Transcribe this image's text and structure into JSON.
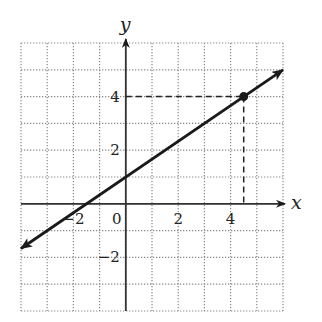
{
  "chart_data": {
    "type": "line",
    "title": "",
    "xlabel": "x",
    "ylabel": "y",
    "xlim": [
      -4,
      6
    ],
    "ylim": [
      -4,
      6
    ],
    "grid": true,
    "grid_style": "dotted",
    "x_tick_labels": [
      {
        "value": -2,
        "label": "−2"
      },
      {
        "value": 0,
        "label": "0"
      },
      {
        "value": 2,
        "label": "2"
      },
      {
        "value": 4,
        "label": "4"
      }
    ],
    "y_tick_labels": [
      {
        "value": 4,
        "label": "4"
      },
      {
        "value": 2,
        "label": "2"
      },
      {
        "value": -2,
        "label": "−2"
      }
    ],
    "series": [
      {
        "name": "line",
        "equation": "y = (2/3)x + 1",
        "slope": 0.6667,
        "intercept": 1,
        "x": [
          -4,
          6
        ],
        "y": [
          -1.667,
          5
        ],
        "arrows": "both",
        "color": "#1a1a1a"
      }
    ],
    "highlight_point": {
      "x": 4.5,
      "y": 4,
      "dashed_guides": true
    }
  }
}
